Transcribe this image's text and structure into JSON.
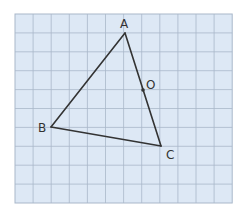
{
  "figure": {
    "grid": {
      "cols": 12,
      "rows": 10,
      "x0": 15,
      "y0": 14,
      "cell_w": 18.1,
      "cell_h": 18.9,
      "fill": "#dde8f5",
      "line": "#a9b7c9"
    },
    "points": [
      {
        "id": "A",
        "label": "A",
        "x": 125,
        "y": 33,
        "lx": 120,
        "ly": 28
      },
      {
        "id": "B",
        "label": "B",
        "x": 51,
        "y": 127,
        "lx": 38,
        "ly": 132
      },
      {
        "id": "C",
        "label": "C",
        "x": 161,
        "y": 146,
        "lx": 166,
        "ly": 159
      },
      {
        "id": "O",
        "label": "O",
        "x": 143,
        "y": 90,
        "lx": 146,
        "ly": 89
      }
    ],
    "segments": [
      [
        "A",
        "B"
      ],
      [
        "B",
        "C"
      ],
      [
        "C",
        "A"
      ]
    ],
    "line_color": "#333333"
  }
}
